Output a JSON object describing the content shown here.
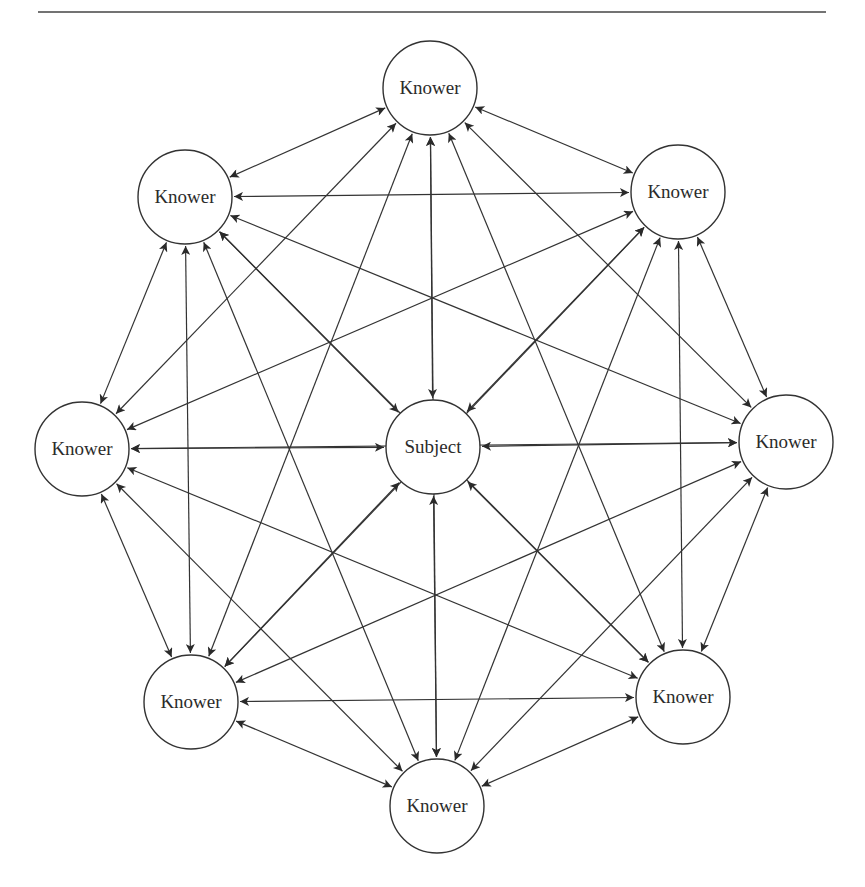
{
  "diagram": {
    "type": "network",
    "nodes": [
      {
        "id": "top",
        "label": "Knower",
        "x": 430,
        "y": 88
      },
      {
        "id": "top-left",
        "label": "Knower",
        "x": 185,
        "y": 197
      },
      {
        "id": "top-right",
        "label": "Knower",
        "x": 678,
        "y": 192
      },
      {
        "id": "left",
        "label": "Knower",
        "x": 82,
        "y": 449
      },
      {
        "id": "center",
        "label": "Subject",
        "x": 433,
        "y": 447
      },
      {
        "id": "right",
        "label": "Knower",
        "x": 786,
        "y": 442
      },
      {
        "id": "bottom-left",
        "label": "Knower",
        "x": 191,
        "y": 702
      },
      {
        "id": "bottom-right",
        "label": "Knower",
        "x": 683,
        "y": 697
      },
      {
        "id": "bottom",
        "label": "Knower",
        "x": 437,
        "y": 806
      }
    ],
    "node_radius": 47,
    "edges": "all-pairs",
    "edge_style": "bidirectional-arrow",
    "line_color": "#333333"
  }
}
